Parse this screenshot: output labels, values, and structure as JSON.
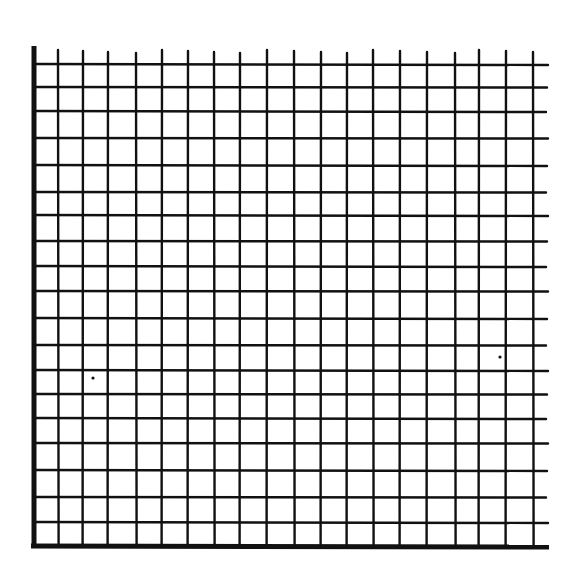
{
  "figure": {
    "background": "#ffffff",
    "ink_color": "#111111"
  },
  "grid": {
    "left_axis": {
      "x": 34,
      "y_top": 46,
      "y_bottom": 548,
      "stroke_width": 5
    },
    "bottom_axis": {
      "y": 546,
      "x_left": 31,
      "x_right": 549,
      "stroke_width": 5
    },
    "vertical_lines": {
      "x": [
        58,
        83,
        108,
        136,
        162,
        188,
        214,
        240,
        267,
        294,
        321,
        347,
        373,
        400,
        427,
        455,
        479,
        506,
        533
      ],
      "y_top": 50,
      "y_bottom": 546,
      "stroke_width": 2.4
    },
    "horizontal_lines": {
      "y": [
        64,
        87,
        111,
        138,
        165,
        192,
        215,
        241,
        266,
        291,
        318,
        345,
        370,
        394,
        418,
        443,
        470,
        497,
        522
      ],
      "x_left": 34,
      "x_right": 548,
      "stroke_width": 2.4
    },
    "specks": [
      {
        "x": 93,
        "y": 378,
        "r": 1.6
      },
      {
        "x": 500,
        "y": 357,
        "r": 1.6
      }
    ]
  }
}
